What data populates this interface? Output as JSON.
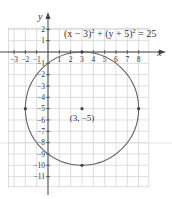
{
  "chart_data": {
    "type": "line",
    "title": "",
    "equation": "(x − 3)² + (y + 5)² = 25",
    "equation_parts": {
      "a": "(x − 3)",
      "exp1": "2",
      "plus": " + (y + 5)",
      "exp2": "2",
      "rhs": " = 25"
    },
    "xlabel": "x",
    "ylabel": "y",
    "xlim": [
      -3.5,
      8.9
    ],
    "ylim": [
      -11.9,
      2.1
    ],
    "grid": true,
    "x_ticks": [
      -3,
      -2,
      -1,
      1,
      2,
      3,
      4,
      5,
      6,
      7,
      8
    ],
    "y_ticks": [
      2,
      1,
      -1,
      -2,
      -3,
      -4,
      -5,
      -6,
      -7,
      -8,
      -9,
      -10,
      -11
    ],
    "circle": {
      "center": [
        3,
        -5
      ],
      "radius": 5
    },
    "highlighted_points": [
      {
        "x": 3,
        "y": 0
      },
      {
        "x": -2,
        "y": -5
      },
      {
        "x": 8,
        "y": -5
      },
      {
        "x": 3,
        "y": -10
      },
      {
        "x": 3,
        "y": -5
      }
    ],
    "annotations": [
      {
        "text": "(3, −5)",
        "x": 3,
        "y": -5.7
      }
    ]
  },
  "labels": {
    "x_axis": "x",
    "y_axis": "y",
    "center": "(3, −5)",
    "x_ticks": [
      "−3",
      "−2",
      "−1",
      "1",
      "2",
      "3",
      "4",
      "5",
      "6",
      "7",
      "8"
    ],
    "y_ticks": [
      "2",
      "1",
      "−1",
      "−2",
      "−3",
      "−4",
      "−5",
      "−6",
      "−7",
      "−8",
      "−9",
      "−10",
      "−11"
    ]
  },
  "colors": {
    "grid": "#d0d0d0",
    "axis": "#444444",
    "curve": "#666666",
    "text": "#333333",
    "stray_line": "#e0e0e0"
  }
}
